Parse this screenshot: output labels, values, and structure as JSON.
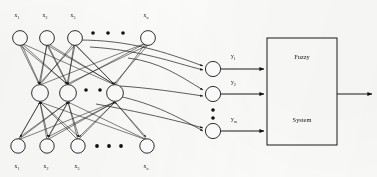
{
  "figure": {
    "type": "neural-network-fuzzy-system-diagram",
    "background_color": "#fdfdfc",
    "ink_color": "#1a1a1a"
  },
  "top_layer": {
    "node_count_visible": 4,
    "ellipsis": "• • •",
    "labels": [
      {
        "base": "x",
        "sub": "1"
      },
      {
        "base": "x",
        "sub": "2"
      },
      {
        "base": "x",
        "sub": "3"
      },
      {
        "base": "x",
        "sub": "n"
      }
    ]
  },
  "middle_layer": {
    "node_count_visible": 3,
    "ellipsis": "• •"
  },
  "bottom_layer": {
    "node_count_visible": 4,
    "ellipsis": "• • •",
    "labels": [
      {
        "base": "x",
        "sub": "1"
      },
      {
        "base": "x",
        "sub": "2"
      },
      {
        "base": "x",
        "sub": "3"
      },
      {
        "base": "x",
        "sub": "n"
      }
    ]
  },
  "output_layer": {
    "node_count_visible": 3,
    "ellipsis_vertical": "• •",
    "labels": [
      {
        "base": "y",
        "sub": "1"
      },
      {
        "base": "y",
        "sub": "2"
      },
      {
        "base": "y",
        "sub": "m"
      }
    ]
  },
  "fuzzy_box": {
    "line1": "Fuzzy",
    "line2": "System",
    "input_arrow_count": 3,
    "output_arrow_count": 1
  }
}
